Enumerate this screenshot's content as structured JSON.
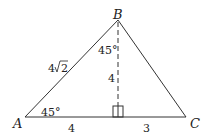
{
  "diagram": {
    "type": "triangle",
    "vertices": {
      "A": {
        "label": "A",
        "x": 25,
        "y": 117
      },
      "B": {
        "label": "B",
        "x": 118,
        "y": 20
      },
      "C": {
        "label": "C",
        "x": 186,
        "y": 117
      }
    },
    "foot": {
      "x": 118,
      "y": 117
    },
    "labels": {
      "side_AB": "4√2",
      "side_AB_coef": "4",
      "side_AB_rad": "2",
      "angle_A": "45°",
      "angle_B_left": "45°",
      "altitude": "4",
      "segment_A_foot": "4",
      "segment_foot_C": "3"
    },
    "colors": {
      "stroke": "#333333",
      "text": "#222222"
    }
  }
}
